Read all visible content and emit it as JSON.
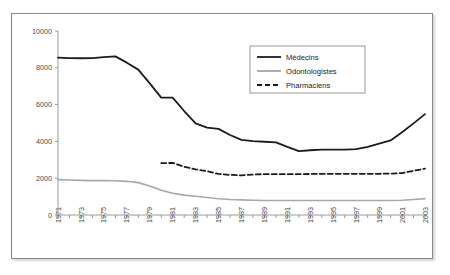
{
  "figure": {
    "frame_border_color": "#8a8a8a",
    "background_color": "#ffffff"
  },
  "chart_data": {
    "type": "line",
    "title": "",
    "subtitle": "",
    "xlabel": "",
    "ylabel": "",
    "xlim": [
      1971,
      2003
    ],
    "ylim": [
      0,
      10000
    ],
    "grid": false,
    "legend_position": "top-right",
    "y_ticks": [
      0,
      2000,
      4000,
      6000,
      8000,
      10000
    ],
    "y_tick_labels": [
      "0",
      "2000",
      "4000",
      "6000",
      "8000",
      "10000"
    ],
    "x_ticks": [
      1971,
      1973,
      1975,
      1977,
      1979,
      1981,
      1983,
      1985,
      1987,
      1989,
      1991,
      1993,
      1995,
      1997,
      1999,
      2001,
      2003
    ],
    "x_tick_labels": [
      "1971",
      "1973",
      "1975",
      "1977",
      "1979",
      "1981",
      "1983",
      "1985",
      "1987",
      "1989",
      "1991",
      "1993",
      "1995",
      "1997",
      "1999",
      "2001",
      "2003"
    ],
    "x": [
      1971,
      1972,
      1973,
      1974,
      1975,
      1976,
      1977,
      1978,
      1979,
      1980,
      1981,
      1982,
      1983,
      1984,
      1985,
      1986,
      1987,
      1988,
      1989,
      1990,
      1991,
      1992,
      1993,
      1994,
      1995,
      1996,
      1997,
      1998,
      1999,
      2000,
      2001,
      2002,
      2003
    ],
    "series": [
      {
        "name": "Médecins",
        "color": "#1c1c1c",
        "style": "solid",
        "width": 1.8,
        "values": [
          8550,
          8530,
          8520,
          8530,
          8580,
          8620,
          8280,
          7900,
          7150,
          6380,
          6380,
          5650,
          4980,
          4750,
          4680,
          4350,
          4080,
          4020,
          3980,
          3950,
          3700,
          3470,
          3520,
          3550,
          3550,
          3550,
          3580,
          3700,
          3880,
          4050,
          4500,
          4980,
          5480
        ]
      },
      {
        "name": "Odontologistes",
        "color": "#a8a8a8",
        "style": "solid",
        "width": 1.6,
        "values": [
          1920,
          1900,
          1880,
          1870,
          1870,
          1860,
          1830,
          1760,
          1580,
          1350,
          1180,
          1080,
          1020,
          950,
          880,
          840,
          820,
          800,
          790,
          790,
          790,
          790,
          790,
          790,
          790,
          790,
          790,
          790,
          790,
          790,
          800,
          840,
          890
        ]
      },
      {
        "name": "Pharmaciens",
        "color": "#1c1c1c",
        "style": "dashed",
        "width": 1.8,
        "start_year": 1980,
        "values": [
          null,
          null,
          null,
          null,
          null,
          null,
          null,
          null,
          null,
          2820,
          2830,
          2620,
          2480,
          2380,
          2230,
          2180,
          2150,
          2200,
          2220,
          2220,
          2220,
          2220,
          2230,
          2230,
          2240,
          2240,
          2240,
          2240,
          2240,
          2250,
          2280,
          2400,
          2520
        ]
      }
    ],
    "legend": [
      {
        "label": "Médecins",
        "color": "#1c1c1c",
        "style": "solid"
      },
      {
        "label": "Odontologistes",
        "color": "#a8a8a8",
        "style": "solid"
      },
      {
        "label": "Pharmaciens",
        "color": "#1c1c1c",
        "style": "dashed"
      }
    ]
  }
}
